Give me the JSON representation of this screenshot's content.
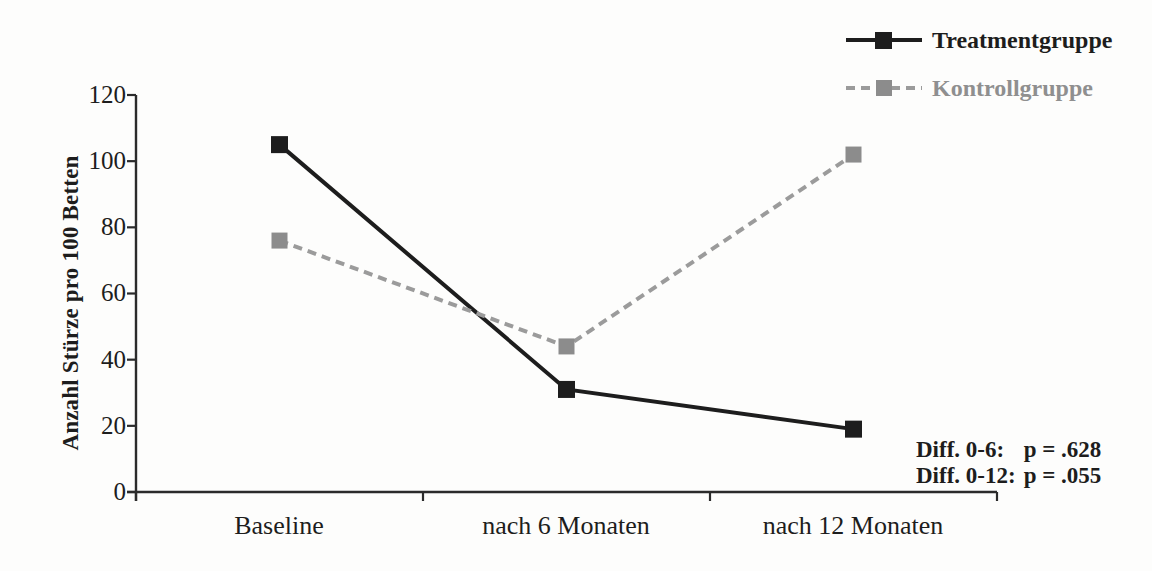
{
  "figure": {
    "background": "#fdfdfc",
    "axis_color": "#2b2b2b"
  },
  "chart_data": {
    "type": "line",
    "categories": [
      "Baseline",
      "nach 6 Monaten",
      "nach 12 Monaten"
    ],
    "series": [
      {
        "name": "Treatmentgruppe",
        "values": [
          105,
          31,
          19
        ],
        "line_color": "#1d1d1d",
        "marker_color": "#1d1d1d",
        "label_color": "#1d1d1d",
        "style": "solid",
        "marker": "square",
        "marker_size": 17
      },
      {
        "name": "Kontrollgruppe",
        "values": [
          76,
          44,
          102
        ],
        "line_color": "#9b9b9b",
        "marker_color": "#8c8c8c",
        "label_color": "#8f8f8f",
        "style": "dashed",
        "marker": "square",
        "marker_size": 16
      }
    ],
    "title": "",
    "xlabel": "",
    "ylabel": "Anzahl Stürze pro 100 Betten",
    "ylim": [
      0,
      120
    ],
    "yticks": [
      0,
      20,
      40,
      60,
      80,
      100,
      120
    ],
    "grid": false,
    "legend_position": "top-right"
  },
  "annotation": {
    "line1_label": "Diff. 0-6:",
    "line1_value": "p = .628",
    "line2_label": "Diff. 0-12:",
    "line2_value": "p = .055"
  }
}
